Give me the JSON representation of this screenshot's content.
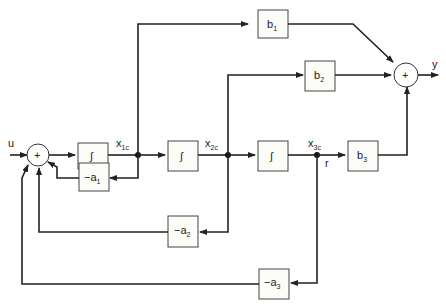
{
  "diagram": {
    "input_label": "u",
    "output_label": "y",
    "summer_symbol": "+",
    "integrator_symbol": "∫",
    "states": [
      {
        "name": "x",
        "sub": "1c"
      },
      {
        "name": "x",
        "sub": "2c"
      },
      {
        "name": "x",
        "sub": "3c"
      }
    ],
    "tap_label": "r",
    "output_gains": [
      {
        "name": "b",
        "sub": "1"
      },
      {
        "name": "b",
        "sub": "2"
      },
      {
        "name": "b",
        "sub": "3"
      }
    ],
    "feedback_gains": [
      {
        "name": "−a",
        "sub": "1"
      },
      {
        "name": "−a",
        "sub": "2"
      },
      {
        "name": "−a",
        "sub": "3"
      }
    ]
  }
}
